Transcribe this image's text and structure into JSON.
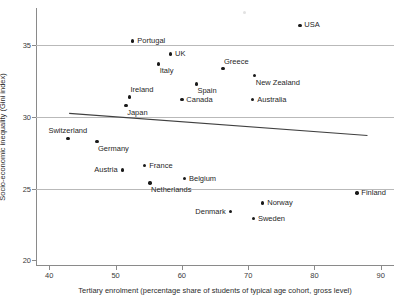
{
  "chart_data": {
    "type": "scatter",
    "title": "",
    "xlabel": "Tertiary enrolment (percentage share of students of typical age cohort, gross level)",
    "ylabel": "Socio-economic inequality (Gini index)",
    "xlim": [
      38,
      92
    ],
    "ylim": [
      19.6,
      37.6
    ],
    "xticks": [
      40,
      50,
      60,
      70,
      80,
      90
    ],
    "yticks": [
      20,
      25,
      30,
      35
    ],
    "grid": "horizontal",
    "gridlines_y": [
      25,
      30,
      35
    ],
    "legend": "none",
    "marker_color": "#1a1a1a",
    "gridline_color": "#b9b9b9",
    "trendline": {
      "type": "linear",
      "x_start": 43.0,
      "y_start": 30.25,
      "x_end": 88.0,
      "y_end": 28.7,
      "color": "#404040"
    },
    "points": [
      {
        "label": "USA",
        "x": 77.8,
        "y": 36.4,
        "label_pos": "right"
      },
      {
        "label": "Portugal",
        "x": 52.6,
        "y": 35.3,
        "label_pos": "right"
      },
      {
        "label": "UK",
        "x": 58.3,
        "y": 34.4,
        "label_pos": "right"
      },
      {
        "label": "Italy",
        "x": 56.5,
        "y": 33.7,
        "label_pos": "br"
      },
      {
        "label": "Greece",
        "x": 66.2,
        "y": 33.4,
        "label_pos": "ar"
      },
      {
        "label": "New Zealand",
        "x": 71.0,
        "y": 32.9,
        "label_pos": "br"
      },
      {
        "label": "Spain",
        "x": 62.2,
        "y": 32.3,
        "label_pos": "br"
      },
      {
        "label": "Ireland",
        "x": 52.1,
        "y": 31.4,
        "label_pos": "ar"
      },
      {
        "label": "Canada",
        "x": 60.0,
        "y": 31.2,
        "label_pos": "right"
      },
      {
        "label": "Australia",
        "x": 70.7,
        "y": 31.2,
        "label_pos": "right"
      },
      {
        "label": "Japan",
        "x": 51.6,
        "y": 30.8,
        "label_pos": "br"
      },
      {
        "label": "Switzerland",
        "x": 42.8,
        "y": 28.5,
        "label_pos": "above"
      },
      {
        "label": "Germany",
        "x": 47.2,
        "y": 28.3,
        "label_pos": "br"
      },
      {
        "label": "France",
        "x": 54.4,
        "y": 26.6,
        "label_pos": "right"
      },
      {
        "label": "Austria",
        "x": 51.0,
        "y": 26.3,
        "label_pos": "left"
      },
      {
        "label": "Belgium",
        "x": 60.4,
        "y": 25.7,
        "label_pos": "right"
      },
      {
        "label": "Netherlands",
        "x": 55.2,
        "y": 25.4,
        "label_pos": "br"
      },
      {
        "label": "Finland",
        "x": 86.4,
        "y": 24.7,
        "label_pos": "right"
      },
      {
        "label": "Norway",
        "x": 72.2,
        "y": 24.0,
        "label_pos": "right"
      },
      {
        "label": "Denmark",
        "x": 67.3,
        "y": 23.4,
        "label_pos": "left"
      },
      {
        "label": "Sweden",
        "x": 70.8,
        "y": 22.9,
        "label_pos": "right"
      }
    ]
  }
}
